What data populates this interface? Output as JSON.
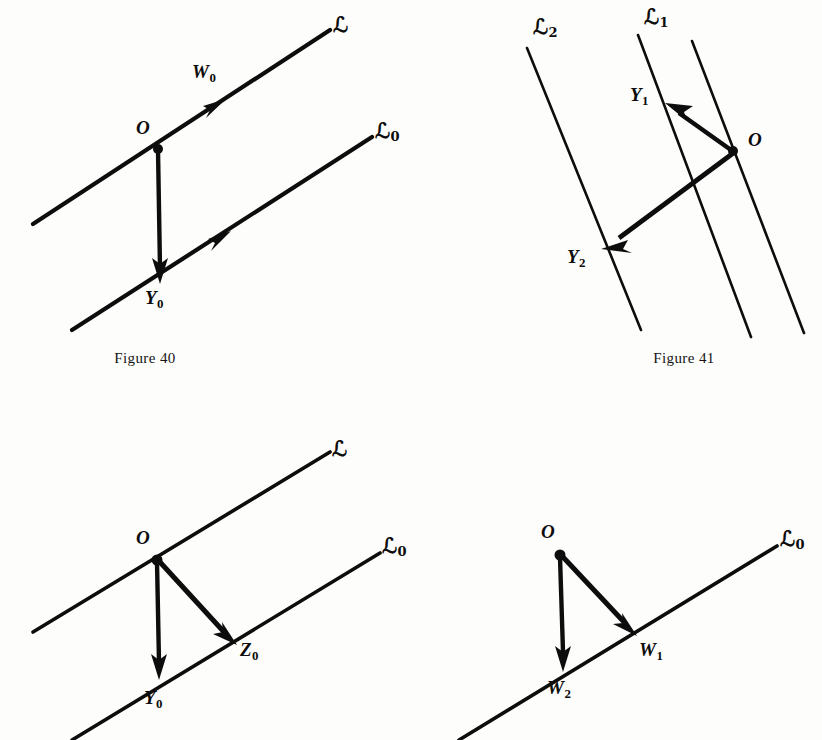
{
  "page": {
    "background": "#fdfdfb",
    "ink": "#0d0d0d"
  },
  "figures": [
    {
      "id": "figure-40",
      "caption": "Figure 40",
      "description": "Two parallel lines with a vertical vector from O down to Y-zero",
      "lines": [
        {
          "name": "L",
          "label": "ℒ",
          "sub": ""
        },
        {
          "name": "L0",
          "label": "ℒ",
          "sub": "0"
        }
      ],
      "points": [
        {
          "name": "O",
          "label": "O",
          "sub": ""
        },
        {
          "name": "Y0",
          "label": "Y",
          "sub": "0"
        }
      ],
      "vectors": [
        {
          "name": "W0",
          "label": "W",
          "sub": "0"
        }
      ]
    },
    {
      "id": "figure-41",
      "caption": "Figure 41",
      "description": "Three slanted parallel lines with vectors from O to Y-one and Y-two",
      "lines": [
        {
          "name": "L2",
          "label": "ℒ",
          "sub": "2"
        },
        {
          "name": "L1",
          "label": "ℒ",
          "sub": "1"
        },
        {
          "name": "L3",
          "label": "",
          "sub": ""
        }
      ],
      "points": [
        {
          "name": "O",
          "label": "O",
          "sub": ""
        },
        {
          "name": "Y1",
          "label": "Y",
          "sub": "1"
        },
        {
          "name": "Y2",
          "label": "Y",
          "sub": "2"
        }
      ],
      "vectors": []
    },
    {
      "id": "figure-lower-left",
      "caption": "",
      "description": "Two parallel lines with vectors from O to Y-zero and Z-zero",
      "lines": [
        {
          "name": "L",
          "label": "ℒ",
          "sub": ""
        },
        {
          "name": "L0",
          "label": "ℒ",
          "sub": "0"
        }
      ],
      "points": [
        {
          "name": "O",
          "label": "O",
          "sub": ""
        },
        {
          "name": "Y0",
          "label": "Y",
          "sub": "0"
        },
        {
          "name": "Z0",
          "label": "Z",
          "sub": "0"
        }
      ],
      "vectors": []
    },
    {
      "id": "figure-lower-right",
      "caption": "",
      "description": "A single line with vectors from O to W-one and W-two",
      "lines": [
        {
          "name": "L0",
          "label": "ℒ",
          "sub": "0"
        }
      ],
      "points": [
        {
          "name": "O",
          "label": "O",
          "sub": ""
        },
        {
          "name": "W1",
          "label": "W",
          "sub": "1"
        },
        {
          "name": "W2",
          "label": "W",
          "sub": "2"
        }
      ],
      "vectors": []
    }
  ]
}
